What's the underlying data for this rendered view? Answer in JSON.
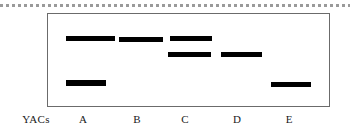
{
  "figure": {
    "row_axis_label": "YACs",
    "panel": {
      "border_color": "#6b6b6b",
      "background_color": "#ffffff"
    },
    "top_rule": {
      "style": "dotted",
      "color": "#9a9a9a"
    },
    "band_color": "#000000"
  },
  "chart_data": {
    "type": "table",
    "title": "",
    "xlabel": "YACs",
    "ylabel": "",
    "categories": [
      "A",
      "B",
      "C",
      "D",
      "E"
    ],
    "row_levels": [
      "top",
      "middle",
      "bottom"
    ],
    "legend": [],
    "grid": false,
    "series": [
      {
        "name": "top",
        "level_y": 38,
        "values": [
          1,
          1,
          1,
          0,
          0
        ]
      },
      {
        "name": "middle",
        "level_y": 53,
        "values": [
          0,
          0,
          1,
          1,
          0
        ]
      },
      {
        "name": "bottom",
        "level_y": 81,
        "values": [
          1,
          0,
          0,
          0,
          1
        ]
      }
    ],
    "bands": [
      {
        "lane": "A",
        "level": "top",
        "x": 66,
        "y": 36,
        "width": 49,
        "height": 5
      },
      {
        "lane": "B",
        "level": "top",
        "x": 119,
        "y": 37,
        "width": 44,
        "height": 5
      },
      {
        "lane": "C",
        "level": "top",
        "x": 170,
        "y": 36,
        "width": 42,
        "height": 5
      },
      {
        "lane": "C",
        "level": "middle",
        "x": 168,
        "y": 52,
        "width": 43,
        "height": 5
      },
      {
        "lane": "D",
        "level": "middle",
        "x": 221,
        "y": 52,
        "width": 41,
        "height": 5
      },
      {
        "lane": "A",
        "level": "bottom",
        "x": 66,
        "y": 80,
        "width": 40,
        "height": 6
      },
      {
        "lane": "E",
        "level": "bottom",
        "x": 271,
        "y": 82,
        "width": 40,
        "height": 5
      }
    ],
    "lane_labels": [
      {
        "label": "A",
        "x": 70,
        "width": 26
      },
      {
        "label": "B",
        "x": 124,
        "width": 26
      },
      {
        "label": "C",
        "x": 172,
        "width": 26
      },
      {
        "label": "D",
        "x": 224,
        "width": 26
      },
      {
        "label": "E",
        "x": 276,
        "width": 26
      }
    ]
  }
}
